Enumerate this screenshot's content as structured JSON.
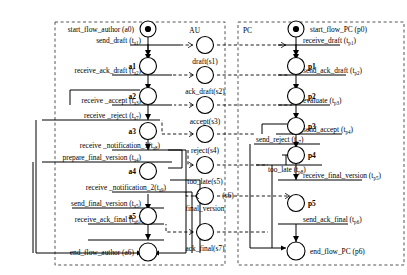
{
  "diagram": {
    "type": "petri-net",
    "title": "",
    "zones": [
      {
        "id": "AU",
        "label": "AU",
        "x": 55,
        "y": 22,
        "w": 470,
        "h": 243
      },
      {
        "id": "PC",
        "label": "PC",
        "x": 238,
        "y": 22,
        "w": 166,
        "h": 243
      }
    ],
    "au": {
      "label": "AU",
      "places": [
        {
          "id": "a0",
          "label": "start_flow_author (a0)",
          "token": true
        },
        {
          "id": "a1",
          "label": "a1",
          "token": false
        },
        {
          "id": "a2",
          "label": "a2",
          "token": false
        },
        {
          "id": "a3",
          "label": "a3",
          "token": false
        },
        {
          "id": "a4",
          "label": "a4",
          "token": false
        },
        {
          "id": "a5",
          "label": "a5",
          "token": false
        },
        {
          "id": "a6",
          "label": "end_flow_author (a6)",
          "token": false
        }
      ],
      "transitions": [
        {
          "id": "ta1",
          "label": "send_draft (t",
          "sub": "a1",
          "close": ")"
        },
        {
          "id": "ta2",
          "label": "receive_ack_draft (t",
          "sub": "a2",
          "close": ")"
        },
        {
          "id": "ta3",
          "label": "receive _accept (t",
          "sub": "a3",
          "close": ")"
        },
        {
          "id": "ta7",
          "label": "receive _reject (t",
          "sub": "a7",
          "close": ")"
        },
        {
          "id": "ta8",
          "label": "receive _notification_1(t",
          "sub": "a8",
          "close": ")"
        },
        {
          "id": "ta4",
          "label": "prepare_final_version (t",
          "sub": "a4",
          "close": ")"
        },
        {
          "id": "ta9",
          "label": "receive _notification_2(t",
          "sub": "a9",
          "close": ")"
        },
        {
          "id": "ta5",
          "label": "send_final_version (t",
          "sub": "a5",
          "close": ")"
        },
        {
          "id": "ta6",
          "label": "receive_ack_final (t",
          "sub": "a6",
          "close": ")"
        }
      ]
    },
    "shared": {
      "places": [
        {
          "id": "s1",
          "label": "draft(s1)"
        },
        {
          "id": "s2",
          "label": "ack_draft(s2)"
        },
        {
          "id": "s3",
          "label": "accept(s3)"
        },
        {
          "id": "s4",
          "label": "reject(s4)"
        },
        {
          "id": "s5",
          "label": "too_late(s5)"
        },
        {
          "id": "s6",
          "label": "final_version",
          "label2": "(s6)"
        },
        {
          "id": "s7",
          "label": "ack_final(s7)"
        }
      ]
    },
    "pc": {
      "label": "PC",
      "places": [
        {
          "id": "p0",
          "label": "start_flow_PC (p0)",
          "token": true
        },
        {
          "id": "p1",
          "label": "p1",
          "token": false
        },
        {
          "id": "p2",
          "label": "p2",
          "token": false
        },
        {
          "id": "p3",
          "label": "p3",
          "token": false
        },
        {
          "id": "p4",
          "label": "p4",
          "token": false
        },
        {
          "id": "p5",
          "label": "p5",
          "token": false
        },
        {
          "id": "p6",
          "label": "end_flow_PC (p6)",
          "token": false
        }
      ],
      "transitions": [
        {
          "id": "tp1",
          "label": "receive_draft (t",
          "sub": "p1",
          "close": ")"
        },
        {
          "id": "tp2",
          "label": "send_ack_draft (t",
          "sub": "p2",
          "close": ")"
        },
        {
          "id": "tp3",
          "label": "evaluate (t",
          "sub": "p3",
          "close": ")"
        },
        {
          "id": "tp4",
          "label": "send_accept (t",
          "sub": "p4",
          "close": ")"
        },
        {
          "id": "tp7",
          "label": "send_reject (t",
          "sub": "p7",
          "close": ")"
        },
        {
          "id": "tp8",
          "label": "too_late (t",
          "sub": "p8",
          "close": ")"
        },
        {
          "id": "tp5",
          "label": "receive_final_version (t",
          "sub": "p5",
          "close": ")"
        },
        {
          "id": "tp6",
          "label": "send_ack_final (t",
          "sub": "p6",
          "close": ")"
        }
      ]
    }
  }
}
